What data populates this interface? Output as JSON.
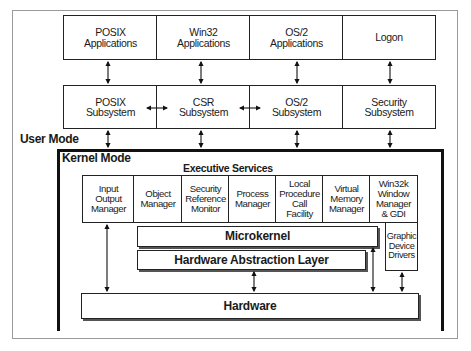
{
  "diagram": {
    "applications": [
      {
        "label": "POSIX\nApplications"
      },
      {
        "label": "Win32\nApplications"
      },
      {
        "label": "OS/2\nApplications"
      },
      {
        "label": "Logon"
      }
    ],
    "subsystems": [
      {
        "label": "POSIX\nSubsystem"
      },
      {
        "label": "CSR\nSubsystem"
      },
      {
        "label": "OS/2\nSubsystem"
      },
      {
        "label": "Security\nSubsystem"
      }
    ],
    "user_mode_label": "User Mode",
    "kernel_mode_label": "Kernel Mode",
    "executive_services_label": "Executive Services",
    "executive_components": [
      {
        "label": "Input\nOutput\nManager"
      },
      {
        "label": "Object\nManager"
      },
      {
        "label": "Security\nReference\nMonitor"
      },
      {
        "label": "Process\nManager"
      },
      {
        "label": "Local\nProcedure\nCall\nFacility"
      },
      {
        "label": "Virtual\nMemory\nManager"
      },
      {
        "label": "Win32k\nWindow\nManager\n& GDI"
      }
    ],
    "microkernel_label": "Microkernel",
    "hal_label": "Hardware Abstraction Layer",
    "graphic_drivers_label": "Graphic\nDevice\nDrivers",
    "hardware_label": "Hardware"
  }
}
